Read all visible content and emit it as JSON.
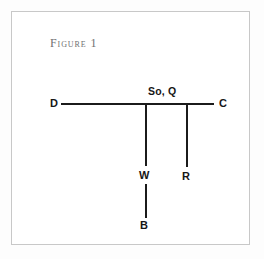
{
  "figure": {
    "caption": "Figure 1",
    "frame_color": "#c8c8c8",
    "stroke_color": "#1b1b1b",
    "caption_color": "#6f6f70",
    "background": "#ffffff"
  },
  "diagram": {
    "type": "stemma-tree",
    "nodes": [
      {
        "id": "D",
        "label": "D",
        "x": 49,
        "y": 91
      },
      {
        "id": "C",
        "label": "C",
        "x": 202,
        "y": 91
      },
      {
        "id": "So_Q",
        "label": "So, Q",
        "x": 155,
        "y": 80
      },
      {
        "id": "W",
        "label": "W",
        "x": 134,
        "y": 163
      },
      {
        "id": "R",
        "label": "R",
        "x": 175,
        "y": 164
      },
      {
        "id": "B",
        "label": "B",
        "x": 134,
        "y": 213
      }
    ],
    "edges": [
      {
        "from": "D",
        "to": "C",
        "orientation": "horizontal"
      },
      {
        "from": "So_Q",
        "to": "W",
        "orientation": "vertical"
      },
      {
        "from": "So_Q",
        "to": "R",
        "orientation": "vertical"
      },
      {
        "from": "W",
        "to": "B",
        "orientation": "vertical"
      }
    ]
  },
  "labels": {
    "d": "D",
    "c": "C",
    "so_q": "So, Q",
    "w": "W",
    "r": "R",
    "b": "B"
  }
}
